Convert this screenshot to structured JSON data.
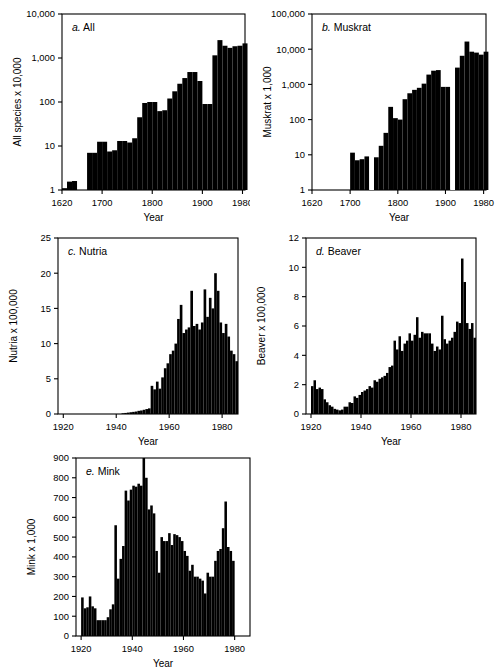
{
  "figure": {
    "name": "fur-harvest-multi-panel-figure",
    "background": "#ffffff",
    "ink": "#000000"
  },
  "chart_data": [
    {
      "id": "a",
      "type": "bar",
      "title": "a. All",
      "label_letter": "a.",
      "label_rest": " All",
      "xlabel": "Year",
      "ylabel": "All species x 10,000",
      "yscale": "log",
      "ylim": [
        1,
        10000
      ],
      "yticks": [
        1,
        10,
        100,
        1000,
        10000
      ],
      "yticklabels": [
        "1",
        "10",
        "100",
        "1,000",
        "10,000"
      ],
      "xlim": [
        1620,
        1985
      ],
      "xticks": [
        1620,
        1700,
        1800,
        1900,
        1980
      ],
      "xticklabels": [
        "1620",
        "1700",
        "1800",
        "1900",
        "1980"
      ],
      "bar_width": 10,
      "x": [
        1620,
        1630,
        1640,
        1650,
        1660,
        1670,
        1680,
        1690,
        1700,
        1710,
        1720,
        1730,
        1740,
        1750,
        1760,
        1770,
        1780,
        1790,
        1800,
        1810,
        1820,
        1830,
        1840,
        1850,
        1860,
        1870,
        1880,
        1890,
        1900,
        1910,
        1920,
        1930,
        1940,
        1950,
        1960,
        1970,
        1980
      ],
      "values": [
        1.1,
        1.55,
        1.6,
        1.0,
        1.0,
        7.0,
        7.0,
        12.5,
        12.5,
        7.5,
        8.0,
        13.0,
        13.0,
        12.0,
        15.0,
        45.0,
        95.0,
        100.0,
        100.0,
        62.0,
        65.0,
        120.0,
        175.0,
        260.0,
        350.0,
        480.0,
        480.0,
        300.0,
        90.0,
        90.0,
        1150.0,
        2550.0,
        1900.0,
        1700.0,
        1850.0,
        1900.0,
        2150.0
      ]
    },
    {
      "id": "b",
      "type": "bar",
      "title": "b. Muskrat",
      "label_letter": "b.",
      "label_rest": " Muskrat",
      "xlabel": "Year",
      "ylabel": "Muskrat x 1,000",
      "yscale": "log",
      "ylim": [
        1,
        100000
      ],
      "yticks": [
        1,
        10,
        100,
        1000,
        10000,
        100000
      ],
      "yticklabels": [
        "1",
        "10",
        "100",
        "1,000",
        "10,000",
        "100,000"
      ],
      "xlim": [
        1620,
        1985
      ],
      "xticks": [
        1620,
        1700,
        1800,
        1900,
        1980
      ],
      "xticklabels": [
        "1620",
        "1700",
        "1800",
        "1900",
        "1980"
      ],
      "bar_width": 10,
      "x": [
        1700,
        1710,
        1720,
        1730,
        1750,
        1760,
        1770,
        1780,
        1790,
        1800,
        1810,
        1820,
        1830,
        1840,
        1850,
        1860,
        1870,
        1880,
        1890,
        1900,
        1920,
        1930,
        1940,
        1950,
        1960,
        1970,
        1980
      ],
      "values": [
        11.5,
        7.0,
        7.5,
        9.0,
        8.5,
        18.0,
        42.0,
        230.0,
        110.0,
        100.0,
        380.0,
        560.0,
        700.0,
        800.0,
        1050.0,
        1900.0,
        2450.0,
        2550.0,
        850.0,
        850.0,
        3000.0,
        6500.0,
        16500.0,
        8500.0,
        8000.0,
        7000.0,
        8500.0
      ],
      "gaps": [
        [
          1740,
          1750
        ],
        [
          1910,
          1920
        ]
      ]
    },
    {
      "id": "c",
      "type": "bar",
      "title": "c. Nutria",
      "label_letter": "c.",
      "label_rest": " Nutria",
      "xlabel": "Year",
      "ylabel": "Nutria x 100,000",
      "yscale": "linear",
      "ylim": [
        0,
        25
      ],
      "yticks": [
        0,
        5,
        10,
        15,
        20,
        25
      ],
      "yticklabels": [
        "0",
        "5",
        "10",
        "15",
        "20",
        "25"
      ],
      "xlim": [
        1918,
        1986
      ],
      "xticks": [
        1920,
        1940,
        1960,
        1980
      ],
      "xticklabels": [
        "1920",
        "1940",
        "1960",
        "1980"
      ],
      "bar_width": 1,
      "x": [
        1920,
        1921,
        1922,
        1923,
        1924,
        1925,
        1926,
        1927,
        1928,
        1929,
        1930,
        1931,
        1932,
        1933,
        1934,
        1935,
        1936,
        1937,
        1938,
        1939,
        1940,
        1941,
        1942,
        1943,
        1944,
        1945,
        1946,
        1947,
        1948,
        1949,
        1950,
        1951,
        1952,
        1953,
        1954,
        1955,
        1956,
        1957,
        1958,
        1959,
        1960,
        1961,
        1962,
        1963,
        1964,
        1965,
        1966,
        1967,
        1968,
        1969,
        1970,
        1971,
        1972,
        1973,
        1974,
        1975,
        1976,
        1977,
        1978,
        1979,
        1980,
        1981,
        1982,
        1983,
        1984,
        1985
      ],
      "values": [
        0,
        0,
        0,
        0,
        0,
        0,
        0,
        0,
        0,
        0,
        0,
        0,
        0,
        0,
        0,
        0,
        0,
        0,
        0,
        0,
        0,
        0,
        0.1,
        0.15,
        0.2,
        0.25,
        0.3,
        0.35,
        0.45,
        0.5,
        0.6,
        0.7,
        0.8,
        4.0,
        3.5,
        4.6,
        3.6,
        5.2,
        6.5,
        7.2,
        8.5,
        9.0,
        10.0,
        13.5,
        15.5,
        11.5,
        12.0,
        12.3,
        17.5,
        12.5,
        12.8,
        12.0,
        13.0,
        17.7,
        13.8,
        16.5,
        15.0,
        20.0,
        17.5,
        13.0,
        11.5,
        12.8,
        11.0,
        9.0,
        8.5,
        7.5
      ]
    },
    {
      "id": "d",
      "type": "bar",
      "title": "d. Beaver",
      "label_letter": "d.",
      "label_rest": " Beaver",
      "xlabel": "Year",
      "ylabel": "Beaver x 100,000",
      "yscale": "linear",
      "ylim": [
        0,
        12
      ],
      "yticks": [
        0,
        2,
        4,
        6,
        8,
        10,
        12
      ],
      "yticklabels": [
        "0",
        "2",
        "4",
        "6",
        "8",
        "10",
        "12"
      ],
      "xlim": [
        1918,
        1986
      ],
      "xticks": [
        1920,
        1940,
        1960,
        1980
      ],
      "xticklabels": [
        "1920",
        "1940",
        "1960",
        "1980"
      ],
      "bar_width": 1,
      "x": [
        1920,
        1921,
        1922,
        1923,
        1924,
        1925,
        1926,
        1927,
        1928,
        1929,
        1930,
        1931,
        1932,
        1933,
        1934,
        1935,
        1936,
        1937,
        1938,
        1939,
        1940,
        1941,
        1942,
        1943,
        1944,
        1945,
        1946,
        1947,
        1948,
        1949,
        1950,
        1951,
        1952,
        1953,
        1954,
        1955,
        1956,
        1957,
        1958,
        1959,
        1960,
        1961,
        1962,
        1963,
        1964,
        1965,
        1966,
        1967,
        1968,
        1969,
        1970,
        1971,
        1972,
        1973,
        1974,
        1975,
        1976,
        1977,
        1978,
        1979,
        1980,
        1981,
        1982,
        1983,
        1984,
        1985
      ],
      "values": [
        1.9,
        2.3,
        1.7,
        1.8,
        1.7,
        1.0,
        0.8,
        0.6,
        0.5,
        0.35,
        0.3,
        0.25,
        0.3,
        0.5,
        0.5,
        0.8,
        0.75,
        1.2,
        1.1,
        1.3,
        1.5,
        1.6,
        1.7,
        1.9,
        1.8,
        2.3,
        2.2,
        2.4,
        2.5,
        2.6,
        2.8,
        3.2,
        3.3,
        5.0,
        4.4,
        5.3,
        4.3,
        4.8,
        5.0,
        5.5,
        5.0,
        5.4,
        6.6,
        5.2,
        5.6,
        5.5,
        5.5,
        5.5,
        4.8,
        4.3,
        4.6,
        4.4,
        6.7,
        5.1,
        4.8,
        5.0,
        5.2,
        5.6,
        6.3,
        6.2,
        10.6,
        9.0,
        6.2,
        5.8,
        6.2,
        5.2
      ]
    },
    {
      "id": "e",
      "type": "bar",
      "title": "e. Mink",
      "label_letter": "e.",
      "label_rest": " Mink",
      "xlabel": "Year",
      "ylabel": "Mink x 1,000",
      "yscale": "linear",
      "ylim": [
        0,
        900
      ],
      "yticks": [
        0,
        100,
        200,
        300,
        400,
        500,
        600,
        700,
        800,
        900
      ],
      "yticklabels": [
        "0",
        "100",
        "200",
        "300",
        "400",
        "500",
        "600",
        "700",
        "800",
        "900"
      ],
      "xlim": [
        1918,
        1986
      ],
      "xticks": [
        1920,
        1940,
        1960,
        1980
      ],
      "xticklabels": [
        "1920",
        "1940",
        "1960",
        "1980"
      ],
      "bar_width": 1,
      "x": [
        1920,
        1921,
        1922,
        1923,
        1924,
        1925,
        1926,
        1927,
        1928,
        1929,
        1930,
        1931,
        1932,
        1933,
        1934,
        1935,
        1936,
        1937,
        1938,
        1939,
        1940,
        1941,
        1942,
        1943,
        1944,
        1945,
        1946,
        1947,
        1948,
        1949,
        1950,
        1951,
        1952,
        1953,
        1954,
        1955,
        1956,
        1957,
        1958,
        1959,
        1960,
        1961,
        1962,
        1963,
        1964,
        1965,
        1966,
        1967,
        1968,
        1969,
        1970,
        1971,
        1972,
        1973,
        1974,
        1975,
        1976,
        1977,
        1978,
        1979,
        1980,
        1981,
        1982,
        1983,
        1984,
        1985
      ],
      "values": [
        195,
        140,
        145,
        200,
        150,
        140,
        80,
        80,
        80,
        80,
        95,
        135,
        160,
        560,
        290,
        390,
        455,
        735,
        685,
        740,
        760,
        755,
        770,
        760,
        900,
        800,
        640,
        660,
        620,
        430,
        320,
        500,
        480,
        480,
        520,
        460,
        515,
        510,
        500,
        480,
        430,
        405,
        330,
        360,
        300,
        300,
        290,
        280,
        215,
        320,
        300,
        300,
        380,
        430,
        440,
        545,
        680,
        450,
        430,
        380,
        0,
        0,
        0,
        0,
        0,
        0
      ]
    }
  ]
}
